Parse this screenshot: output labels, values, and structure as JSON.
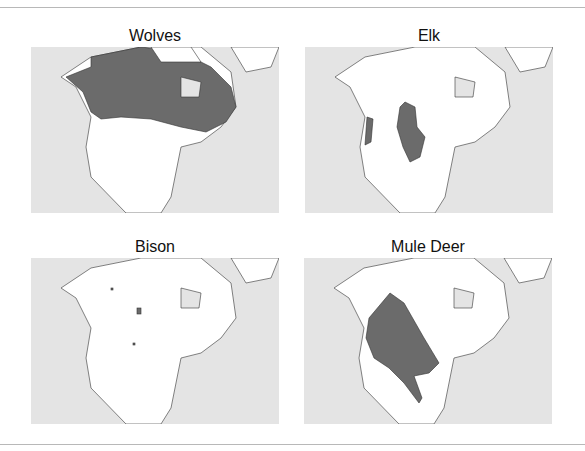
{
  "figure": {
    "panels": [
      {
        "title": "Wolves",
        "range": "Canada, Alaska, northern Great Lakes"
      },
      {
        "title": "Elk",
        "range": "Rocky Mountains, Pacific Northwest coast"
      },
      {
        "title": "Bison",
        "range": "Small scattered isolated patches"
      },
      {
        "title": "Mule Deer",
        "range": "Western North America to northern Mexico"
      }
    ],
    "colors": {
      "ocean": "#e4e4e4",
      "land": "#ffffff",
      "range": "#6b6b6b",
      "border": "#333333"
    }
  }
}
